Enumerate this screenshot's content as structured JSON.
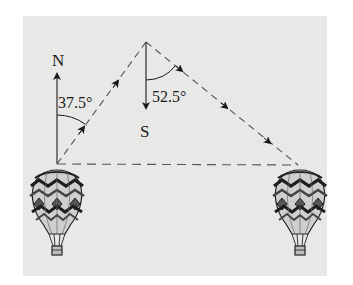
{
  "diagram": {
    "colors": {
      "background": "#ffffff",
      "panel": "#e8e8e6",
      "ink": "#1a1a1a",
      "dash": "#555555"
    },
    "labels": {
      "north": "N",
      "south": "S",
      "angle_north": "37.5°",
      "angle_south": "52.5°"
    },
    "points": {
      "start": [
        57,
        164
      ],
      "apex": [
        146,
        42
      ],
      "end": [
        298,
        165
      ]
    },
    "legs": [
      {
        "from": "start",
        "to": "apex",
        "bearing": "N 37.5° E",
        "arrows": 2
      },
      {
        "from": "apex",
        "to": "end",
        "bearing": "S 52.5° E",
        "arrows": 3
      },
      {
        "from": "start",
        "to": "end",
        "style": "dashed",
        "arrows": 0
      }
    ],
    "objects": [
      {
        "name": "hot-air-balloon-left",
        "position": [
          57,
          212
        ]
      },
      {
        "name": "hot-air-balloon-right",
        "position": [
          300,
          212
        ]
      }
    ]
  }
}
